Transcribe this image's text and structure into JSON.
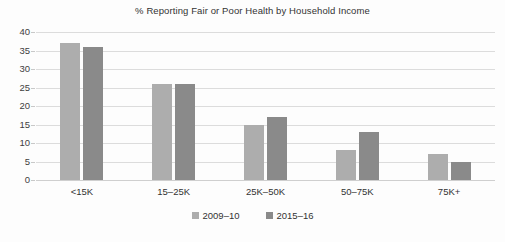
{
  "chart_data": {
    "type": "bar",
    "title": "% Reporting Fair or Poor Health by Household Income",
    "xlabel": "",
    "ylabel": "",
    "categories": [
      "<15K",
      "15–25K",
      "25K–50K",
      "50–75K",
      "75K+"
    ],
    "series": [
      {
        "name": "2009–10",
        "color": "#adadad",
        "values": [
          37,
          26,
          15,
          8,
          7
        ]
      },
      {
        "name": "2015–16",
        "color": "#8a8a8a",
        "values": [
          36,
          26,
          17,
          13,
          5
        ]
      }
    ],
    "ylim": [
      0,
      40
    ],
    "ytick_labels": [
      "40",
      "35",
      "30",
      "25",
      "20",
      "15",
      "10",
      "5",
      "0"
    ],
    "ytick_values": [
      40,
      35,
      30,
      25,
      20,
      15,
      10,
      5,
      0
    ],
    "grid": true,
    "legend_position": "bottom"
  }
}
